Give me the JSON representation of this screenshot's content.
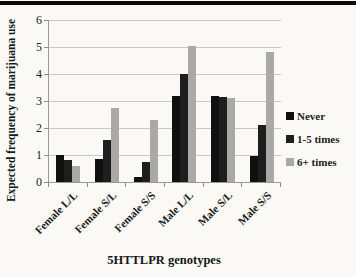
{
  "page": {
    "background_color": "#faf9f6",
    "top_band_color": "#0b0b0b"
  },
  "chart_data": {
    "type": "bar",
    "title": "",
    "xlabel": "5HTTLPR genotypes",
    "ylabel": "Expected frequency of marijuana use",
    "categories": [
      "Female L/L",
      "Female S/L",
      "Female S/S",
      "Male L/L",
      "Male S/L",
      "Male S/S"
    ],
    "series": [
      {
        "name": "Never",
        "color": "#101010",
        "values": [
          1.0,
          0.85,
          0.2,
          3.2,
          3.2,
          0.95
        ]
      },
      {
        "name": "1-5 times",
        "color": "#1e1e1e",
        "values": [
          0.8,
          1.55,
          0.75,
          4.0,
          3.15,
          2.1
        ]
      },
      {
        "name": "6+ times",
        "color": "#aaa9a6",
        "values": [
          0.6,
          2.75,
          2.3,
          5.05,
          3.1,
          4.8
        ]
      }
    ],
    "ylim": [
      0,
      6
    ],
    "yticks": [
      0,
      1,
      2,
      3,
      4,
      5,
      6
    ],
    "grid": true,
    "legend_position": "right",
    "gridline_color": "#c9c8c3",
    "axis_color": "#9b9a96"
  }
}
